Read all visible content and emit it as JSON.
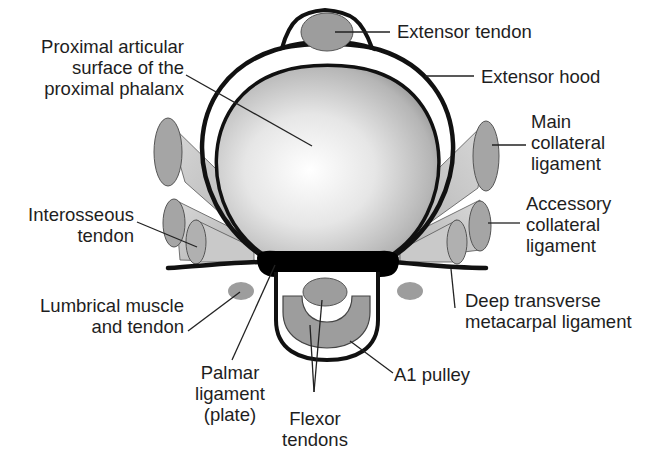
{
  "diagram": {
    "type": "anatomical cross-section",
    "colors": {
      "outline": "#111111",
      "tendon_fill": "#9d9d9d",
      "ligament_fill": "#c8c8c8",
      "bone_highlight": "#ffffff",
      "bone_shadow": "#8e8e8e",
      "plate_fill": "#000000",
      "text": "#1e1e1e"
    },
    "labels": {
      "extensor_tendon": "Extensor tendon",
      "extensor_hood": "Extensor hood",
      "proximal_articular": "Proximal articular\nsurface of the\nproximal phalanx",
      "main_collateral": "Main\ncollateral\nligament",
      "accessory_collateral": "Accessory\ncollateral\nligament",
      "interosseous": "Interosseous\ntendon",
      "lumbrical": "Lumbrical muscle\nand tendon",
      "deep_transverse": "Deep transverse\nmetacarpal ligament",
      "palmar_ligament": "Palmar\nligament\n(plate)",
      "flexor_tendons": "Flexor\ntendons",
      "a1_pulley": "A1 pulley"
    }
  }
}
